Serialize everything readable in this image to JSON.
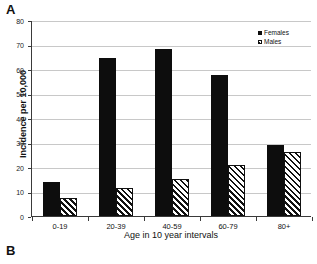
{
  "panels": {
    "a_label": "A",
    "b_label": "B"
  },
  "legend": {
    "position": "top-right",
    "entries": [
      {
        "label": "Females",
        "marker": "filled-square",
        "color": "#0d0d0d"
      },
      {
        "label": "Males",
        "marker": "hatched-square",
        "color": "#ffffff"
      }
    ]
  },
  "chart_data": {
    "type": "bar",
    "title": "",
    "xlabel": "Age in 10 year intervals",
    "ylabel": "Incidence per 10,000",
    "categories": [
      "0-19",
      "20-39",
      "40-59",
      "60-79",
      "80+"
    ],
    "series": [
      {
        "name": "Females",
        "values": [
          14,
          64.5,
          68,
          57.5,
          29
        ],
        "color": "#0d0d0d"
      },
      {
        "name": "Males",
        "values": [
          7.5,
          11.5,
          15,
          21,
          26
        ],
        "color": "#ffffff"
      }
    ],
    "ylim": [
      0,
      80
    ],
    "yticks": [
      0,
      10,
      20,
      30,
      40,
      50,
      60,
      70,
      80
    ],
    "ytick_labels": [
      "0",
      "10",
      "20",
      "30",
      "40",
      "50",
      "60",
      "70",
      "80"
    ],
    "grid": true,
    "grid_axis": "y",
    "legend_position": "top-right"
  }
}
